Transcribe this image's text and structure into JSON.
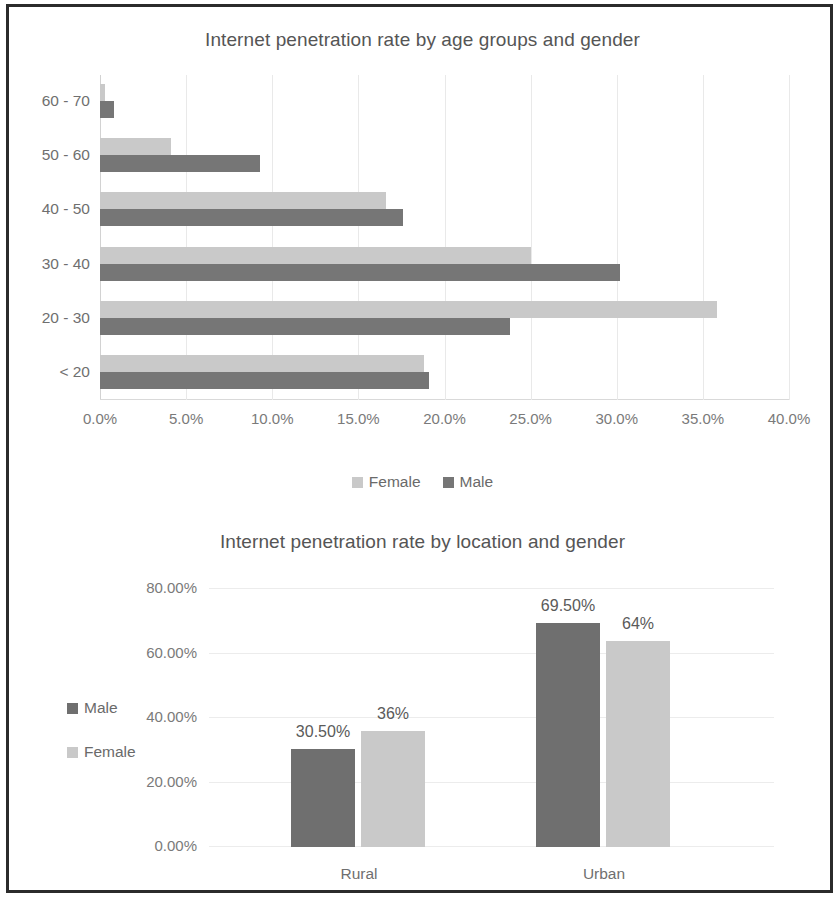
{
  "colors": {
    "male": "#6f6f6f",
    "female": "#c9c9c9",
    "border": "#2b2b2b",
    "text": "#555555",
    "grid": "#ececec"
  },
  "charts": {
    "age": {
      "title": "Internet penetration rate by age groups and gender",
      "legend": [
        {
          "label": "Female",
          "color": "#c9c9c9"
        },
        {
          "label": "Male",
          "color": "#767676"
        }
      ],
      "xticks": [
        "0.0%",
        "5.0%",
        "10.0%",
        "15.0%",
        "20.0%",
        "25.0%",
        "30.0%",
        "35.0%",
        "40.0%"
      ],
      "categories": [
        "60 - 70",
        "50 - 60",
        "40 - 50",
        "30 - 40",
        "20 - 30",
        "< 20"
      ]
    },
    "location": {
      "title": "Internet penetration rate by location and gender",
      "legend": [
        {
          "label": "Male",
          "color": "#6f6f6f"
        },
        {
          "label": "Female",
          "color": "#c9c9c9"
        }
      ],
      "yticks": [
        "80.00%",
        "60.00%",
        "40.00%",
        "20.00%",
        "0.00%"
      ],
      "categories": [
        "Rural",
        "Urban"
      ],
      "labels": {
        "rural_male": "30.50%",
        "rural_female": "36%",
        "urban_male": "69.50%",
        "urban_female": "64%"
      }
    }
  },
  "chart_data": [
    {
      "type": "bar",
      "orientation": "horizontal",
      "title": "Internet penetration rate by age groups and gender",
      "xlabel": "",
      "ylabel": "",
      "categories": [
        "< 20",
        "20 - 30",
        "30 - 40",
        "40 - 50",
        "50 - 60",
        "60 - 70"
      ],
      "series": [
        {
          "name": "Male",
          "color": "#767676",
          "values": [
            19.1,
            23.8,
            30.2,
            17.6,
            9.3,
            0.8
          ]
        },
        {
          "name": "Female",
          "color": "#c9c9c9",
          "values": [
            18.8,
            35.8,
            25.0,
            16.6,
            4.1,
            0.3
          ]
        }
      ],
      "xlim": [
        0,
        40
      ],
      "xticks": [
        0,
        5,
        10,
        15,
        20,
        25,
        30,
        35,
        40
      ],
      "xtick_labels": [
        "0.0%",
        "5.0%",
        "10.0%",
        "15.0%",
        "20.0%",
        "25.0%",
        "30.0%",
        "35.0%",
        "40.0%"
      ],
      "grid": true,
      "legend_position": "bottom"
    },
    {
      "type": "bar",
      "orientation": "vertical",
      "title": "Internet penetration rate by location and gender",
      "xlabel": "",
      "ylabel": "",
      "categories": [
        "Rural",
        "Urban"
      ],
      "series": [
        {
          "name": "Male",
          "color": "#6f6f6f",
          "values": [
            30.5,
            69.5
          ],
          "labels": [
            "30.50%",
            "69.50%"
          ]
        },
        {
          "name": "Female",
          "color": "#c9c9c9",
          "values": [
            36,
            64
          ],
          "labels": [
            "36%",
            "64%"
          ]
        }
      ],
      "ylim": [
        0,
        80
      ],
      "yticks": [
        0,
        20,
        40,
        60,
        80
      ],
      "ytick_labels": [
        "0.00%",
        "20.00%",
        "40.00%",
        "60.00%",
        "80.00%"
      ],
      "grid": true,
      "legend_position": "left"
    }
  ]
}
